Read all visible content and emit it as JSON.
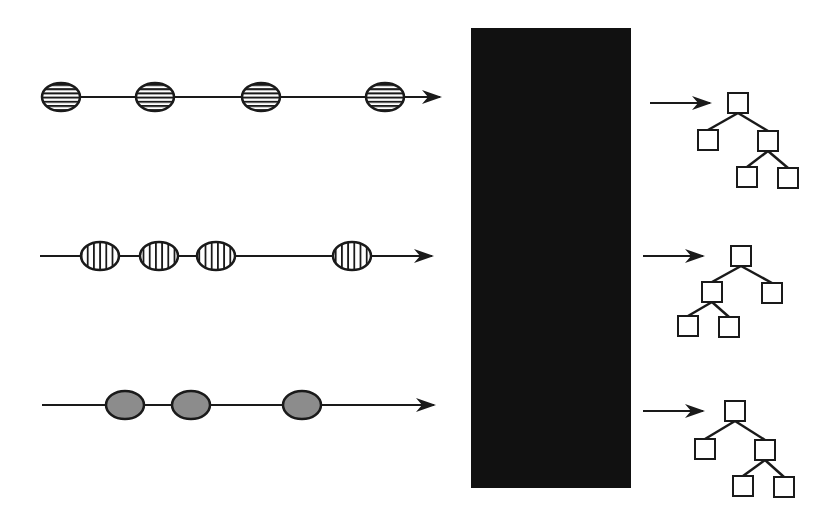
{
  "diagram": {
    "colors": {
      "background": "#ffffff",
      "stroke": "#1a1a1a",
      "black_box": "#111111",
      "solid_fill": "#8c8c8c"
    },
    "black_box": {
      "x": 471,
      "y": 28,
      "width": 160,
      "height": 460,
      "label": ""
    },
    "sequences": [
      {
        "id": "horizontal-striped",
        "pattern": "horizontal-stripes",
        "line": {
          "x1": 42,
          "x2": 440,
          "y": 97
        },
        "nodes": [
          {
            "cx": 61,
            "cy": 96
          },
          {
            "cx": 155,
            "cy": 97
          },
          {
            "cx": 261,
            "cy": 101
          },
          {
            "cx": 385,
            "cy": 102
          }
        ]
      },
      {
        "id": "vertical-striped",
        "pattern": "vertical-stripes",
        "line": {
          "x1": 40,
          "x2": 432,
          "y": 256
        },
        "nodes": [
          {
            "cx": 100,
            "cy": 253
          },
          {
            "cx": 159,
            "cy": 254
          },
          {
            "cx": 216,
            "cy": 255
          },
          {
            "cx": 352,
            "cy": 257
          }
        ]
      },
      {
        "id": "solid-gray",
        "pattern": "solid",
        "line": {
          "x1": 42,
          "x2": 434,
          "y": 405
        },
        "nodes": [
          {
            "cx": 125,
            "cy": 404
          },
          {
            "cx": 191,
            "cy": 406
          },
          {
            "cx": 302,
            "cy": 407
          }
        ]
      }
    ],
    "output_arrows": [
      {
        "x1": 650,
        "x2": 710,
        "y": 103
      },
      {
        "x1": 643,
        "x2": 703,
        "y": 256
      },
      {
        "x1": 643,
        "x2": 703,
        "y": 411
      }
    ],
    "trees": [
      {
        "id": "tree-1",
        "boxes": [
          [
            738,
            103
          ],
          [
            708,
            140
          ],
          [
            768,
            141
          ],
          [
            747,
            177
          ],
          [
            788,
            178
          ]
        ],
        "edges": [
          [
            0,
            1
          ],
          [
            0,
            2
          ],
          [
            2,
            3
          ],
          [
            2,
            4
          ]
        ]
      },
      {
        "id": "tree-2",
        "boxes": [
          [
            741,
            256
          ],
          [
            712,
            292
          ],
          [
            772,
            293
          ],
          [
            688,
            326
          ],
          [
            729,
            327
          ]
        ],
        "edges": [
          [
            0,
            1
          ],
          [
            0,
            2
          ],
          [
            1,
            3
          ],
          [
            1,
            4
          ]
        ]
      },
      {
        "id": "tree-3",
        "boxes": [
          [
            735,
            411
          ],
          [
            705,
            449
          ],
          [
            765,
            450
          ],
          [
            743,
            486
          ],
          [
            784,
            487
          ]
        ],
        "edges": [
          [
            0,
            1
          ],
          [
            0,
            2
          ],
          [
            2,
            3
          ],
          [
            2,
            4
          ]
        ]
      }
    ]
  }
}
